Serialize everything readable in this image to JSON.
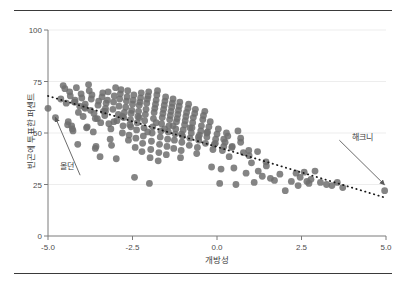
{
  "figure": {
    "background": "#ffffff",
    "rule_color": "#3a3a3a"
  },
  "chart_data": {
    "type": "scatter",
    "title": "",
    "subtitle": "",
    "xlabel": "개방성",
    "ylabel": "빈곤에 투표한 퍼센트",
    "xlim": [
      -5.0,
      5.0
    ],
    "ylim": [
      0,
      100
    ],
    "xticks": [
      "-5.0",
      "-2.5",
      "0.0",
      "2.5",
      "5.0"
    ],
    "xtick_values": [
      -5.0,
      -2.5,
      0.0,
      2.5,
      5.0
    ],
    "yticks": [
      "0",
      "25",
      "50",
      "75",
      "100"
    ],
    "ytick_values": [
      0,
      25,
      50,
      75,
      100
    ],
    "grid": "horizontal",
    "grid_color": "#ededed",
    "legend": "none",
    "point_color": "#6e6e6e",
    "point_opacity": 0.85,
    "point_radius": 3.4,
    "trendline": {
      "style": "dotted",
      "color": "#1a1a1a",
      "x_start": -5.0,
      "y_start": 68.0,
      "x_end": 5.0,
      "y_end": 18.5
    },
    "annotations": [
      {
        "label": "몰던",
        "label_x": -4.05,
        "label_y": 29.5,
        "point_x": -4.78,
        "point_y": 57.5
      },
      {
        "label": "해크니",
        "label_x": 3.62,
        "label_y": 46.5,
        "point_x": 4.95,
        "point_y": 25.0
      }
    ],
    "x": [
      -5.0,
      -4.62,
      -4.55,
      -4.5,
      -4.46,
      -4.42,
      -4.4,
      -4.36,
      -4.34,
      -4.3,
      -4.28,
      -4.26,
      -4.22,
      -4.2,
      -4.16,
      -4.12,
      -4.1,
      -4.06,
      -4.02,
      -4.0,
      -3.96,
      -3.92,
      -3.9,
      -3.86,
      -3.84,
      -3.8,
      -3.78,
      -3.74,
      -3.72,
      -3.7,
      -3.66,
      -3.64,
      -3.6,
      -3.58,
      -3.54,
      -3.52,
      -3.5,
      -3.46,
      -3.44,
      -3.4,
      -3.38,
      -3.36,
      -3.32,
      -3.3,
      -3.28,
      -3.24,
      -3.22,
      -3.2,
      -3.16,
      -3.14,
      -3.12,
      -3.08,
      -3.06,
      -3.04,
      -3.0,
      -2.98,
      -2.96,
      -2.92,
      -2.9,
      -2.88,
      -2.86,
      -2.84,
      -2.8,
      -2.78,
      -2.76,
      -2.74,
      -2.7,
      -2.68,
      -2.66,
      -2.64,
      -2.62,
      -2.6,
      -2.58,
      -2.56,
      -2.54,
      -2.52,
      -2.5,
      -2.48,
      -2.46,
      -2.44,
      -2.42,
      -2.4,
      -2.38,
      -2.36,
      -2.34,
      -2.32,
      -2.3,
      -2.28,
      -2.26,
      -2.24,
      -2.22,
      -2.2,
      -2.18,
      -2.16,
      -2.14,
      -2.12,
      -2.1,
      -2.08,
      -2.06,
      -2.04,
      -2.02,
      -2.0,
      -1.98,
      -1.96,
      -1.94,
      -1.92,
      -1.9,
      -1.88,
      -1.86,
      -1.84,
      -1.82,
      -1.8,
      -1.78,
      -1.76,
      -1.74,
      -1.72,
      -1.7,
      -1.68,
      -1.66,
      -1.64,
      -1.62,
      -1.6,
      -1.58,
      -1.56,
      -1.54,
      -1.52,
      -1.5,
      -1.48,
      -1.46,
      -1.44,
      -1.42,
      -1.4,
      -1.38,
      -1.36,
      -1.34,
      -1.32,
      -1.3,
      -1.28,
      -1.26,
      -1.24,
      -1.22,
      -1.2,
      -1.18,
      -1.16,
      -1.14,
      -1.12,
      -1.1,
      -1.08,
      -1.06,
      -1.04,
      -1.02,
      -1.0,
      -0.96,
      -0.94,
      -0.92,
      -0.9,
      -0.86,
      -0.84,
      -0.82,
      -0.8,
      -0.76,
      -0.74,
      -0.72,
      -0.7,
      -0.66,
      -0.64,
      -0.6,
      -0.58,
      -0.54,
      -0.52,
      -0.48,
      -0.46,
      -0.42,
      -0.4,
      -0.36,
      -0.34,
      -0.3,
      -0.28,
      -0.24,
      -0.2,
      -0.16,
      -0.12,
      -0.08,
      -0.04,
      0.0,
      0.04,
      0.08,
      0.12,
      0.16,
      0.2,
      0.24,
      0.28,
      0.32,
      0.36,
      0.44,
      0.5,
      0.56,
      0.62,
      0.7,
      0.78,
      0.86,
      0.94,
      1.02,
      1.1,
      1.22,
      1.34,
      1.46,
      1.58,
      1.7,
      1.86,
      2.02,
      2.2,
      2.34,
      2.4,
      2.46,
      2.58,
      2.66,
      2.72,
      2.78,
      2.9,
      3.06,
      3.24,
      3.4,
      3.56,
      3.72,
      4.96,
      -4.78,
      -4.2,
      -3.9,
      -3.6,
      -3.3,
      -3.05,
      -2.8,
      -2.55,
      -2.3,
      -2.05,
      -1.8,
      -1.55,
      -1.3,
      -1.05,
      -0.8,
      -0.55,
      -0.3,
      -0.05,
      0.2,
      0.45,
      0.7,
      0.95,
      1.2,
      1.45
    ],
    "y": [
      62.0,
      66.5,
      73.0,
      71.5,
      64.5,
      54.0,
      55.5,
      70.0,
      68.0,
      53.5,
      52.0,
      51.0,
      65.0,
      66.0,
      72.0,
      44.5,
      60.0,
      63.0,
      69.0,
      67.0,
      58.0,
      62.5,
      64.0,
      52.5,
      53.0,
      73.5,
      70.5,
      61.0,
      66.5,
      68.5,
      50.5,
      59.5,
      42.5,
      43.5,
      57.0,
      63.5,
      65.5,
      38.5,
      55.0,
      67.5,
      69.5,
      60.5,
      58.5,
      62.0,
      64.5,
      66.0,
      70.0,
      54.5,
      47.0,
      52.0,
      44.0,
      61.5,
      65.0,
      68.0,
      72.0,
      37.5,
      56.0,
      59.0,
      63.0,
      66.5,
      69.0,
      71.0,
      50.0,
      53.5,
      57.5,
      60.0,
      62.5,
      65.5,
      67.5,
      70.5,
      46.5,
      49.0,
      54.0,
      56.5,
      59.5,
      61.0,
      64.0,
      66.0,
      68.5,
      28.5,
      43.0,
      47.5,
      51.5,
      55.0,
      58.0,
      60.5,
      63.5,
      65.0,
      67.0,
      69.5,
      41.0,
      45.0,
      48.5,
      52.5,
      56.0,
      59.0,
      61.5,
      64.5,
      66.5,
      68.0,
      70.0,
      25.5,
      38.0,
      42.0,
      46.0,
      50.0,
      53.0,
      57.0,
      60.0,
      62.0,
      64.0,
      66.0,
      68.5,
      70.5,
      36.5,
      40.5,
      44.5,
      48.0,
      51.0,
      54.5,
      57.5,
      59.5,
      61.5,
      63.5,
      65.5,
      67.5,
      39.5,
      43.5,
      47.0,
      50.5,
      53.5,
      56.5,
      58.5,
      60.5,
      62.5,
      64.5,
      66.5,
      42.5,
      46.5,
      49.5,
      52.0,
      55.5,
      57.0,
      59.0,
      61.0,
      63.0,
      65.0,
      38.0,
      41.5,
      45.5,
      48.5,
      51.5,
      54.0,
      56.0,
      58.0,
      60.0,
      62.0,
      64.0,
      44.0,
      47.5,
      50.0,
      52.5,
      55.0,
      57.5,
      59.5,
      61.5,
      40.0,
      43.0,
      46.5,
      49.0,
      51.0,
      53.5,
      56.5,
      58.5,
      60.5,
      45.0,
      48.0,
      50.5,
      53.0,
      55.5,
      33.5,
      42.0,
      44.5,
      47.0,
      49.5,
      52.0,
      25.5,
      32.5,
      41.5,
      43.5,
      45.5,
      50.0,
      48.5,
      38.5,
      43.0,
      33.0,
      25.0,
      51.0,
      47.5,
      40.5,
      30.5,
      41.5,
      35.5,
      26.0,
      31.5,
      29.0,
      34.0,
      28.0,
      27.0,
      30.0,
      22.0,
      26.5,
      30.5,
      24.5,
      28.5,
      31.0,
      26.5,
      25.5,
      27.5,
      31.5,
      26.0,
      25.0,
      24.5,
      26.0,
      23.5,
      22.0,
      57.5,
      65.0,
      62.0,
      57.0,
      60.5,
      55.5,
      58.0,
      53.0,
      57.5,
      50.5,
      55.0,
      52.0,
      53.5,
      49.5,
      52.5,
      48.0,
      50.0,
      45.0,
      47.0,
      43.5,
      45.5,
      39.0,
      41.0,
      36.0
    ]
  }
}
